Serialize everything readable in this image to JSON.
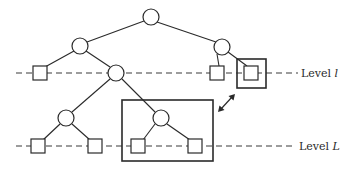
{
  "diagram": {
    "type": "tree-with-levels",
    "levels": [
      {
        "id": "level-l",
        "label_prefix": "Level ",
        "label_var": "l",
        "y": 73
      },
      {
        "id": "level-L",
        "label_prefix": "Level ",
        "label_var": "L",
        "y": 146
      }
    ],
    "internal_nodes": [
      {
        "id": "root",
        "x": 151,
        "y": 17
      },
      {
        "id": "n-left",
        "x": 80,
        "y": 46
      },
      {
        "id": "n-right",
        "x": 222,
        "y": 47
      },
      {
        "id": "n-mid",
        "x": 116,
        "y": 73
      },
      {
        "id": "n-lowleft",
        "x": 66,
        "y": 118
      },
      {
        "id": "n-sub",
        "x": 161,
        "y": 118
      }
    ],
    "leaf_nodes": [
      {
        "id": "leaf-l-1",
        "x": 40,
        "y": 73
      },
      {
        "id": "leaf-l-2",
        "x": 217,
        "y": 73
      },
      {
        "id": "leaf-l-3",
        "x": 251,
        "y": 73,
        "boxed": true
      },
      {
        "id": "leaf-L-1",
        "x": 38,
        "y": 146
      },
      {
        "id": "leaf-L-2",
        "x": 95,
        "y": 146
      },
      {
        "id": "leaf-L-3",
        "x": 138,
        "y": 146
      },
      {
        "id": "leaf-L-4",
        "x": 195,
        "y": 146
      }
    ],
    "highlight_boxes": [
      {
        "id": "box-leaf",
        "x": 237,
        "y": 59,
        "w": 29,
        "h": 29
      },
      {
        "id": "box-subtree",
        "x": 122,
        "y": 100,
        "w": 91,
        "h": 61
      }
    ],
    "correspondence_arrow": {
      "from": [
        218,
        112
      ],
      "to": [
        235,
        94
      ],
      "style": "double-headed"
    }
  },
  "labels": {
    "level_l": {
      "prefix": "Level ",
      "var": "l"
    },
    "level_L": {
      "prefix": "Level ",
      "var": "L"
    }
  }
}
